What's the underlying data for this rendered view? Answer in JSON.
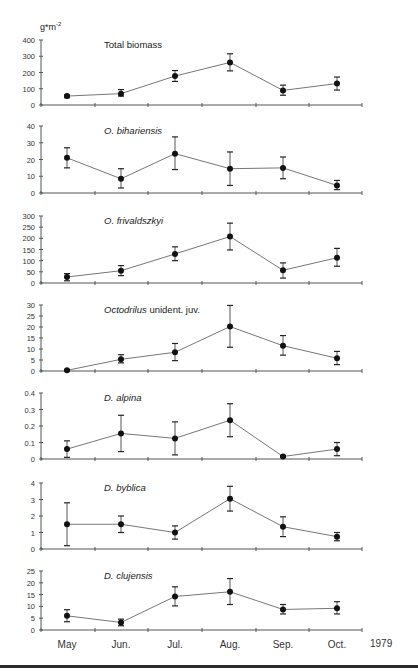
{
  "figure": {
    "y_unit_label": "g*m",
    "y_unit_exponent": "-2",
    "x_categories": [
      "May",
      "Jun.",
      "Jul.",
      "Aug.",
      "Sep.",
      "Oct."
    ],
    "year_label": "1979"
  },
  "chart_data": [
    {
      "type": "line",
      "title": "Total biomass",
      "title_italic": false,
      "ylabel": "g*m-2",
      "xlabel": "",
      "categories": [
        "May",
        "Jun.",
        "Jul.",
        "Aug.",
        "Sep.",
        "Oct."
      ],
      "values": [
        55,
        70,
        178,
        262,
        90,
        132
      ],
      "error_low": [
        45,
        55,
        145,
        210,
        60,
        92
      ],
      "error_high": [
        62,
        95,
        212,
        315,
        122,
        172
      ],
      "ylim": [
        0,
        400
      ],
      "yticks": [
        0,
        100,
        200,
        300,
        400
      ]
    },
    {
      "type": "line",
      "title": "O. bihariensis",
      "title_italic": true,
      "categories": [
        "May",
        "Jun.",
        "Jul.",
        "Aug.",
        "Sep.",
        "Oct."
      ],
      "values": [
        21,
        8.5,
        23.5,
        14.5,
        15,
        4.5
      ],
      "error_low": [
        15,
        3,
        14,
        4.5,
        8.5,
        2
      ],
      "error_high": [
        27,
        14.5,
        33.5,
        24.5,
        21.5,
        7.5
      ],
      "ylim": [
        0,
        40
      ],
      "yticks": [
        0,
        10,
        20,
        30,
        40
      ]
    },
    {
      "type": "line",
      "title": "O. frivaldszkyi",
      "title_italic": true,
      "categories": [
        "May",
        "Jun.",
        "Jul.",
        "Aug.",
        "Sep.",
        "Oct."
      ],
      "values": [
        27,
        55,
        130,
        208,
        57,
        113
      ],
      "error_low": [
        10,
        33,
        100,
        148,
        22,
        75
      ],
      "error_high": [
        42,
        78,
        162,
        268,
        90,
        155
      ],
      "ylim": [
        0,
        300
      ],
      "yticks": [
        0,
        50,
        100,
        150,
        200,
        250,
        300
      ]
    },
    {
      "type": "line",
      "title": "Octodrilus",
      "title_suffix": " unident. juv.",
      "title_italic": true,
      "categories": [
        "May",
        "Jun.",
        "Jul.",
        "Aug.",
        "Sep.",
        "Oct."
      ],
      "values": [
        0.3,
        5.3,
        8.5,
        20.2,
        11.5,
        5.8
      ],
      "error_low": [
        0,
        3.7,
        4.7,
        10.8,
        7.2,
        2.9
      ],
      "error_high": [
        0.6,
        7.4,
        12.5,
        29.8,
        16.1,
        8.9
      ],
      "ylim": [
        0,
        30
      ],
      "yticks": [
        0,
        5,
        10,
        15,
        20,
        25,
        30
      ]
    },
    {
      "type": "line",
      "title": "D. alpina",
      "title_italic": true,
      "categories": [
        "May",
        "Jun.",
        "Jul.",
        "Aug.",
        "Sep.",
        "Oct."
      ],
      "values": [
        0.06,
        0.155,
        0.125,
        0.235,
        0.015,
        0.06
      ],
      "error_low": [
        0.01,
        0.045,
        0.025,
        0.135,
        0.01,
        0.02
      ],
      "error_high": [
        0.11,
        0.265,
        0.225,
        0.335,
        0.02,
        0.1
      ],
      "ylim": [
        0,
        0.4
      ],
      "yticks": [
        0,
        0.1,
        0.2,
        0.3,
        0.4
      ]
    },
    {
      "type": "line",
      "title": "D. byblica",
      "title_italic": true,
      "categories": [
        "May",
        "Jun.",
        "Jul.",
        "Aug.",
        "Sep.",
        "Oct."
      ],
      "values": [
        1.5,
        1.5,
        1.0,
        3.05,
        1.35,
        0.75
      ],
      "error_low": [
        0.2,
        1.0,
        0.6,
        2.3,
        0.75,
        0.5
      ],
      "error_high": [
        2.8,
        2.0,
        1.4,
        3.8,
        1.95,
        1.0
      ],
      "ylim": [
        0,
        4
      ],
      "yticks": [
        0,
        1,
        2,
        3,
        4
      ]
    },
    {
      "type": "line",
      "title": "D. clujensis",
      "title_italic": true,
      "xlabel": "1979",
      "categories": [
        "May",
        "Jun.",
        "Jul.",
        "Aug.",
        "Sep.",
        "Oct."
      ],
      "values": [
        6,
        3.2,
        14.2,
        16.2,
        8.7,
        9.2
      ],
      "error_low": [
        3.5,
        1.8,
        10.2,
        10.8,
        6.8,
        6.8
      ],
      "error_high": [
        8.6,
        4.6,
        18.3,
        21.8,
        10.8,
        12
      ],
      "ylim": [
        0,
        25
      ],
      "yticks": [
        0,
        5,
        10,
        15,
        20,
        25
      ]
    }
  ]
}
